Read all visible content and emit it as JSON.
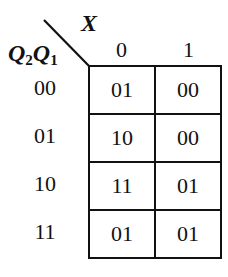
{
  "kmap": {
    "column_variable": "X",
    "row_variables": {
      "first": "Q",
      "first_sub": "2",
      "second": "Q",
      "second_sub": "1"
    },
    "column_headers": [
      "0",
      "1"
    ],
    "row_headers": [
      "00",
      "01",
      "10",
      "11"
    ],
    "cells": [
      [
        "01",
        "00"
      ],
      [
        "10",
        "00"
      ],
      [
        "11",
        "01"
      ],
      [
        "01",
        "01"
      ]
    ],
    "line_color": "#111111"
  }
}
